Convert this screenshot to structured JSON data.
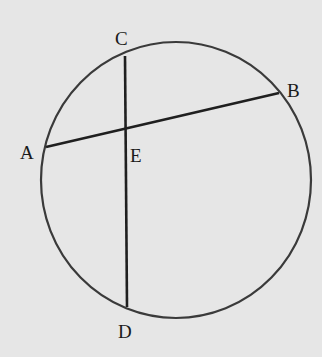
{
  "diagram": {
    "type": "circle-with-intersecting-chords",
    "background": "#e6e6e6",
    "stroke_color": "#2a2a2a",
    "circle": {
      "cx": 176,
      "cy": 180,
      "rx": 135,
      "ry": 138
    },
    "points": {
      "A": {
        "x": 46,
        "y": 147
      },
      "B": {
        "x": 279,
        "y": 93
      },
      "C": {
        "x": 125,
        "y": 56
      },
      "D": {
        "x": 127,
        "y": 307
      },
      "E": {
        "x": 125,
        "y": 128
      }
    },
    "chords": [
      {
        "name": "AB",
        "from": "A",
        "to": "B"
      },
      {
        "name": "CD",
        "from": "C",
        "to": "D"
      }
    ],
    "labels": {
      "A": "A",
      "B": "B",
      "C": "C",
      "D": "D",
      "E": "E"
    }
  }
}
